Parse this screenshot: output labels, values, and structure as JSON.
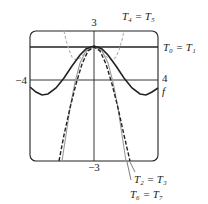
{
  "chart_data": {
    "type": "line",
    "title": "",
    "xlabel": "",
    "ylabel": "",
    "xlim": [
      -4,
      4
    ],
    "ylim": [
      -3,
      3
    ],
    "grid": false,
    "tick_labels": {
      "x_left": "−4",
      "x_right": "4",
      "y_top": "3",
      "y_bottom": "−3"
    },
    "series": [
      {
        "name": "f",
        "label": "f",
        "style": "solid-black",
        "points_px": [
          [
            30,
            87
          ],
          [
            36,
            92
          ],
          [
            42,
            95
          ],
          [
            48,
            94
          ],
          [
            56,
            88
          ],
          [
            64,
            78
          ],
          [
            72,
            66
          ],
          [
            80,
            55
          ],
          [
            86,
            49
          ],
          [
            91,
            47
          ],
          [
            94,
            46
          ],
          [
            97,
            47
          ],
          [
            102,
            49
          ],
          [
            108,
            55
          ],
          [
            116,
            66
          ],
          [
            124,
            78
          ],
          [
            132,
            88
          ],
          [
            140,
            94
          ],
          [
            146,
            95
          ],
          [
            152,
            92
          ],
          [
            158,
            88
          ]
        ]
      },
      {
        "name": "T0 = T1",
        "label": "T₀ = T₁",
        "style": "solid-black-hline",
        "y_value": 1,
        "points_px": [
          [
            30,
            47
          ],
          [
            158,
            47
          ]
        ]
      },
      {
        "name": "T2 = T3",
        "label": "T₂ = T₃",
        "style": "dashed-black",
        "points_px": [
          [
            59,
            161
          ],
          [
            64,
            135
          ],
          [
            70,
            108
          ],
          [
            76,
            84
          ],
          [
            82,
            64
          ],
          [
            88,
            51
          ],
          [
            94,
            47
          ],
          [
            100,
            51
          ],
          [
            106,
            64
          ],
          [
            112,
            84
          ],
          [
            118,
            108
          ],
          [
            124,
            135
          ],
          [
            130,
            161
          ]
        ]
      },
      {
        "name": "T4 = T5",
        "label": "T₄ = T₅",
        "style": "dashed-grey",
        "points_px": [
          [
            64,
            31
          ],
          [
            66,
            40
          ],
          [
            69,
            50
          ],
          [
            72,
            57
          ],
          [
            76,
            60
          ],
          [
            80,
            58
          ],
          [
            85,
            53
          ],
          [
            90,
            48
          ],
          [
            94,
            47
          ],
          [
            98,
            48
          ],
          [
            103,
            53
          ],
          [
            108,
            58
          ],
          [
            112,
            60
          ],
          [
            116,
            57
          ],
          [
            119,
            50
          ],
          [
            122,
            40
          ],
          [
            124,
            31
          ]
        ]
      },
      {
        "name": "T6 = T7",
        "label": "T₆ = T₇",
        "style": "solid-grey",
        "points_px": [
          [
            62,
            161
          ],
          [
            66,
            135
          ],
          [
            70,
            108
          ],
          [
            75,
            82
          ],
          [
            80,
            63
          ],
          [
            86,
            51
          ],
          [
            94,
            47
          ],
          [
            102,
            51
          ],
          [
            108,
            63
          ],
          [
            113,
            82
          ],
          [
            118,
            108
          ],
          [
            122,
            135
          ],
          [
            126,
            161
          ]
        ]
      }
    ],
    "axis_lines_px": {
      "x_axis_y": 80,
      "y_axis_x": 94
    },
    "frame_px": {
      "left": 30,
      "top": 31,
      "right": 158,
      "bottom": 161,
      "radius": 6
    }
  },
  "labels": {
    "y_top": "3",
    "y_bottom": "−3",
    "x_left": "−4",
    "x_right": "4",
    "f_label": "f",
    "t45": "T₄ = T₅",
    "t01": "T₀ = T₁",
    "t23": "T₂ = T₃",
    "t67": "T₆ = T₇"
  },
  "colors": {
    "ink": "#222222",
    "grey_curve": "#9a9a9a",
    "grey_dash": "#b0b0b0"
  }
}
